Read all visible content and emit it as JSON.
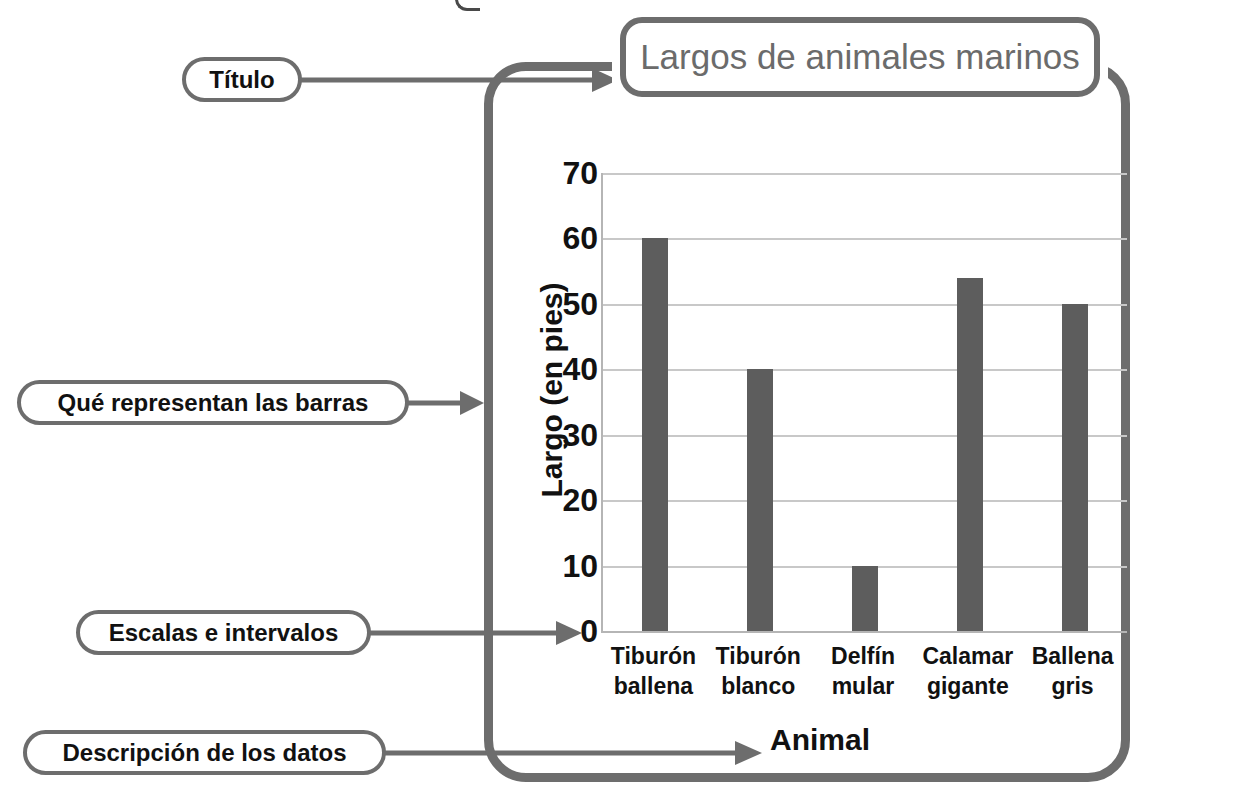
{
  "chart_data": {
    "type": "bar",
    "title": "Largos de animales marinos",
    "xlabel": "Animal",
    "ylabel": "Largo (en pies)",
    "categories": [
      "Tiburón ballena",
      "Tiburón blanco",
      "Delfín mular",
      "Calamar gigante",
      "Ballena gris"
    ],
    "category_lines": [
      [
        "Tiburón",
        "ballena"
      ],
      [
        "Tiburón",
        "blanco"
      ],
      [
        "Delfín",
        "mular"
      ],
      [
        "Calamar",
        "gigante"
      ],
      [
        "Ballena",
        "gris"
      ]
    ],
    "values": [
      60,
      40,
      10,
      54,
      50
    ],
    "ylim": [
      0,
      70
    ],
    "ytick_values": [
      0,
      10,
      20,
      30,
      40,
      50,
      60,
      70
    ],
    "ytick_labels": [
      "0",
      "10",
      "20",
      "30",
      "40",
      "50",
      "60",
      "70"
    ],
    "grid": true,
    "legend": "none",
    "bar_color": "#5d5d5d",
    "grid_color": "#c8c8c8",
    "title_color": "#6b6b6b"
  },
  "annotations": {
    "frame_color": "#6d6d6d",
    "callouts": [
      {
        "id": "titulo",
        "label": "Título",
        "points_to": "chart title"
      },
      {
        "id": "barras",
        "label": "Qué representan las barras",
        "points_to": "y axis label"
      },
      {
        "id": "escalas",
        "label": "Escalas e intervalos",
        "points_to": "y axis scale"
      },
      {
        "id": "datos",
        "label": "Descripción de los datos",
        "points_to": "x axis label"
      }
    ]
  }
}
